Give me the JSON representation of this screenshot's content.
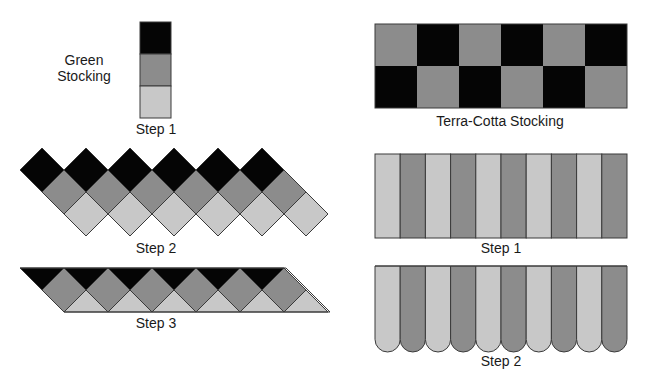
{
  "colors": {
    "dark": "#050505",
    "medium": "#8c8c8c",
    "light": "#c8c8c8",
    "outline": "#3a3a3a",
    "background": "#ffffff"
  },
  "green_stocking": {
    "title": "Green\nStocking",
    "title_line1": "Green",
    "title_line2": "Stocking",
    "step1": {
      "label": "Step 1",
      "stack": [
        "dark",
        "medium",
        "light"
      ]
    },
    "step2": {
      "label": "Step 2",
      "diamond_rows": [
        {
          "color": "dark",
          "count": 6
        },
        {
          "color": "medium",
          "count": 6
        },
        {
          "color": "light",
          "count": 6
        }
      ]
    },
    "step3": {
      "label": "Step 3",
      "description": "parallelogram strip: dark triangles on top, medium diamonds middle, light triangles on bottom",
      "diamond_count": 6
    }
  },
  "terra_cotta_stocking": {
    "title": "Terra-Cotta Stocking",
    "checkerboard": {
      "rows": [
        [
          "medium",
          "dark",
          "medium",
          "dark",
          "medium",
          "dark"
        ],
        [
          "dark",
          "medium",
          "dark",
          "medium",
          "dark",
          "medium"
        ]
      ]
    },
    "step1": {
      "label": "Step 1",
      "stripes": [
        "light",
        "medium",
        "light",
        "medium",
        "light",
        "medium",
        "light",
        "medium",
        "light",
        "medium"
      ]
    },
    "step2": {
      "label": "Step 2",
      "stripes": [
        "light",
        "medium",
        "light",
        "medium",
        "light",
        "medium",
        "light",
        "medium",
        "light",
        "medium"
      ],
      "bottom": "rounded"
    }
  }
}
